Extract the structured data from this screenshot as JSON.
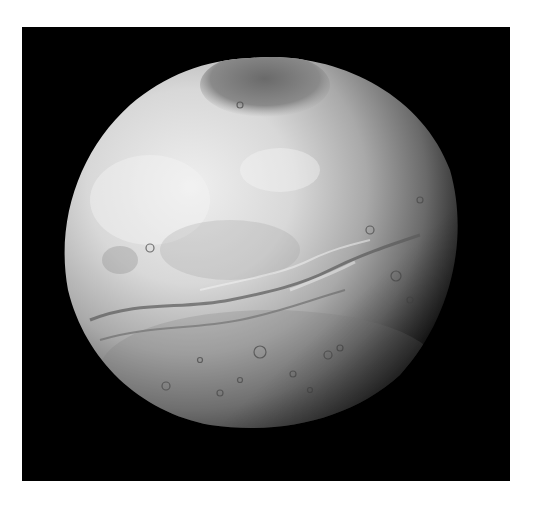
{
  "image": {
    "subject": "Moon Charon (grayscale planetary photograph)",
    "background_color": "#000000",
    "border_color": "#ffffff",
    "moon": {
      "light_color": "#e6e6e6",
      "mid_color": "#a8a8a8",
      "dark_polar_cap_color": "#6e6e6e",
      "terminator_color": "#1a1a1a"
    }
  }
}
